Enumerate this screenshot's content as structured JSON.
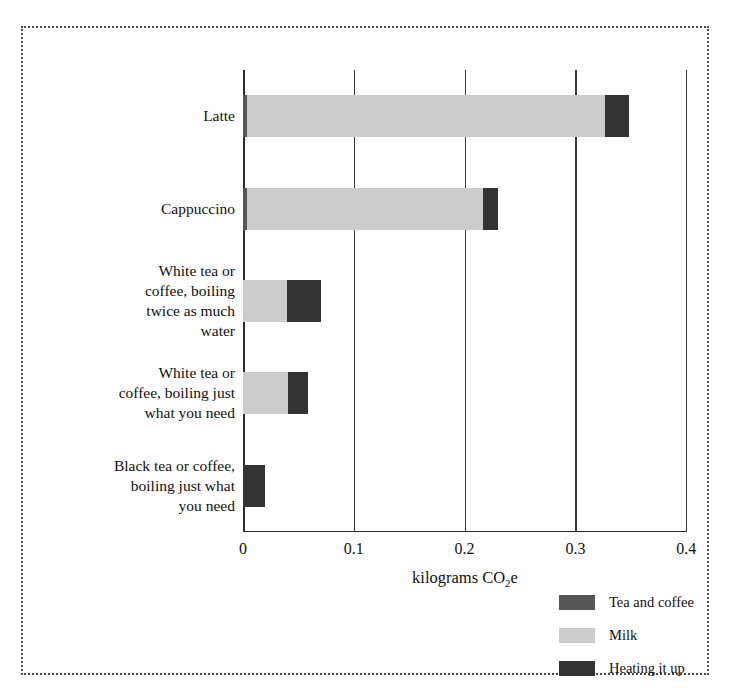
{
  "chart_data": {
    "type": "bar",
    "orientation": "horizontal",
    "stacked": true,
    "title": "",
    "subtitle": "",
    "xlabel": "kilograms CO2e",
    "xlabel_parts": {
      "pre": "kilograms CO",
      "sub": "2",
      "post": "e"
    },
    "ylabel": "",
    "xlim": [
      0,
      0.4
    ],
    "xticks": [
      0,
      0.1,
      0.2,
      0.3,
      0.4
    ],
    "xticklabels": [
      "0",
      "0.1",
      "0.2",
      "0.3",
      "0.4"
    ],
    "grid": true,
    "grid_axis": "x",
    "legend_position": "lower right",
    "categories": [
      "Latte",
      "Cappuccino",
      "White tea or\ncoffee, boiling\ntwice as much\nwater",
      "White tea or\ncoffee, boiling just\nwhat you need",
      "Black tea or coffee,\nboiling just what\nyou need"
    ],
    "series": [
      {
        "name": "Tea and coffee",
        "color": "#555555",
        "values": [
          0.004,
          0.004,
          0.0,
          0.0,
          0.0
        ]
      },
      {
        "name": "Milk",
        "color": "#cccccc",
        "values": [
          0.323,
          0.213,
          0.04,
          0.041,
          0.0
        ]
      },
      {
        "name": "Heating it up",
        "color": "#333333",
        "values": [
          0.021,
          0.013,
          0.03,
          0.018,
          0.02
        ]
      }
    ],
    "totals": [
      0.348,
      0.23,
      0.07,
      0.059,
      0.02
    ]
  },
  "legend": {
    "items": [
      {
        "label": "Tea and coffee",
        "color": "#555555"
      },
      {
        "label": "Milk",
        "color": "#cccccc"
      },
      {
        "label": "Heating it up",
        "color": "#333333"
      }
    ]
  },
  "colors": {
    "tea_and_coffee": "#555555",
    "milk": "#cccccc",
    "heating_it_up": "#333333",
    "axis": "#2b2b2b",
    "frame": "#4a4a4a",
    "background": "#ffffff"
  }
}
